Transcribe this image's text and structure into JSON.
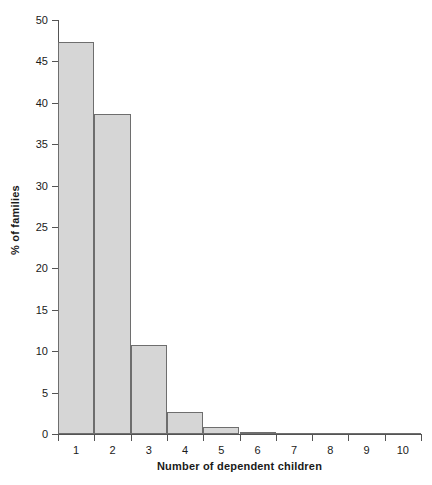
{
  "chart_data": {
    "type": "bar",
    "title": "",
    "subtitle": "",
    "xlabel": "Number of dependent children",
    "ylabel": "% of families",
    "categories": [
      "1",
      "2",
      "3",
      "4",
      "5",
      "6",
      "7",
      "8",
      "9",
      "10"
    ],
    "values": [
      47.3,
      38.6,
      10.7,
      2.6,
      0.8,
      0.2,
      0,
      0,
      0,
      0
    ],
    "series": [
      {
        "name": "% of families",
        "values": [
          47.3,
          38.6,
          10.7,
          2.6,
          0.8,
          0.2,
          0,
          0,
          0,
          0
        ]
      }
    ],
    "ylim": [
      0,
      50
    ],
    "xlim": [
      0.5,
      10.5
    ],
    "ytick_labels": [
      "0",
      "5",
      "10",
      "15",
      "20",
      "25",
      "30",
      "35",
      "40",
      "45",
      "50"
    ],
    "ytick_values": [
      0,
      5,
      10,
      15,
      20,
      25,
      30,
      35,
      40,
      45,
      50
    ],
    "xtick_labels": [
      "1",
      "2",
      "3",
      "4",
      "5",
      "6",
      "7",
      "8",
      "9",
      "10"
    ],
    "xtick_values": [
      1,
      2,
      3,
      4,
      5,
      6,
      7,
      8,
      9,
      10
    ],
    "grid": false,
    "legend": false,
    "legend_position": "none",
    "bar_fill_color": "#d6d6d6",
    "bar_edge_color": "#6e6e6e",
    "axis_color": "#545454",
    "background_color": "#ffffff",
    "annotations": []
  }
}
